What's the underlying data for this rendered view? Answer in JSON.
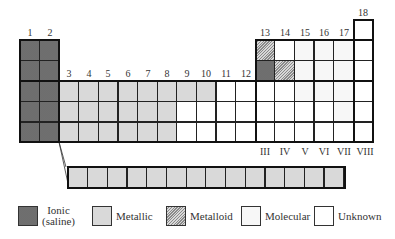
{
  "diagram": {
    "group_labels": [
      "1",
      "2",
      "3",
      "4",
      "5",
      "6",
      "7",
      "8",
      "9",
      "10",
      "11",
      "12",
      "13",
      "14",
      "15",
      "16",
      "17",
      "18"
    ],
    "roman_labels": [
      "III",
      "IV",
      "V",
      "VI",
      "VII",
      "VIII"
    ],
    "categories": {
      "I": "ionic",
      "M": "metallic",
      "D": "metalloid",
      "L": "molecular",
      "U": "unknown"
    },
    "main_table": [
      {
        "row": 1,
        "cells": {
          "18": "U"
        }
      },
      {
        "row": 2,
        "cells": {
          "1": "I",
          "2": "I",
          "13": "D",
          "14": "U",
          "15": "L",
          "16": "L",
          "17": "L",
          "18": "U"
        }
      },
      {
        "row": 3,
        "cells": {
          "1": "I",
          "2": "I",
          "13": "I",
          "14": "D",
          "15": "L",
          "16": "L",
          "17": "L",
          "18": "U"
        }
      },
      {
        "row": 4,
        "cells": {
          "1": "I",
          "2": "I",
          "3": "M",
          "4": "M",
          "5": "M",
          "6": "M",
          "7": "M",
          "8": "M",
          "9": "M",
          "10": "M",
          "11": "U",
          "12": "U",
          "13": "U",
          "14": "U",
          "15": "L",
          "16": "L",
          "17": "L",
          "18": "U"
        }
      },
      {
        "row": 5,
        "cells": {
          "1": "I",
          "2": "I",
          "3": "M",
          "4": "M",
          "5": "M",
          "6": "M",
          "7": "M",
          "8": "M",
          "9": "U",
          "10": "U",
          "11": "U",
          "12": "U",
          "13": "U",
          "14": "U",
          "15": "U",
          "16": "U",
          "17": "L",
          "18": "U"
        }
      },
      {
        "row": 6,
        "cells": {
          "1": "I",
          "2": "I",
          "3": "M",
          "4": "M",
          "5": "M",
          "6": "M",
          "7": "M",
          "8": "M",
          "9": "U",
          "10": "U",
          "11": "U",
          "12": "U",
          "13": "U",
          "14": "U",
          "15": "U",
          "16": "U",
          "17": "U",
          "18": "U"
        }
      }
    ],
    "f_block": {
      "count": 14,
      "category": "M"
    },
    "legend": [
      {
        "key": "I",
        "label_line1": "Ionic",
        "label_line2": "(saline)"
      },
      {
        "key": "M",
        "label_line1": "Metallic",
        "label_line2": ""
      },
      {
        "key": "D",
        "label_line1": "Metalloid",
        "label_line2": ""
      },
      {
        "key": "L",
        "label_line1": "Molecular",
        "label_line2": ""
      },
      {
        "key": "U",
        "label_line1": "Unknown",
        "label_line2": ""
      }
    ]
  }
}
